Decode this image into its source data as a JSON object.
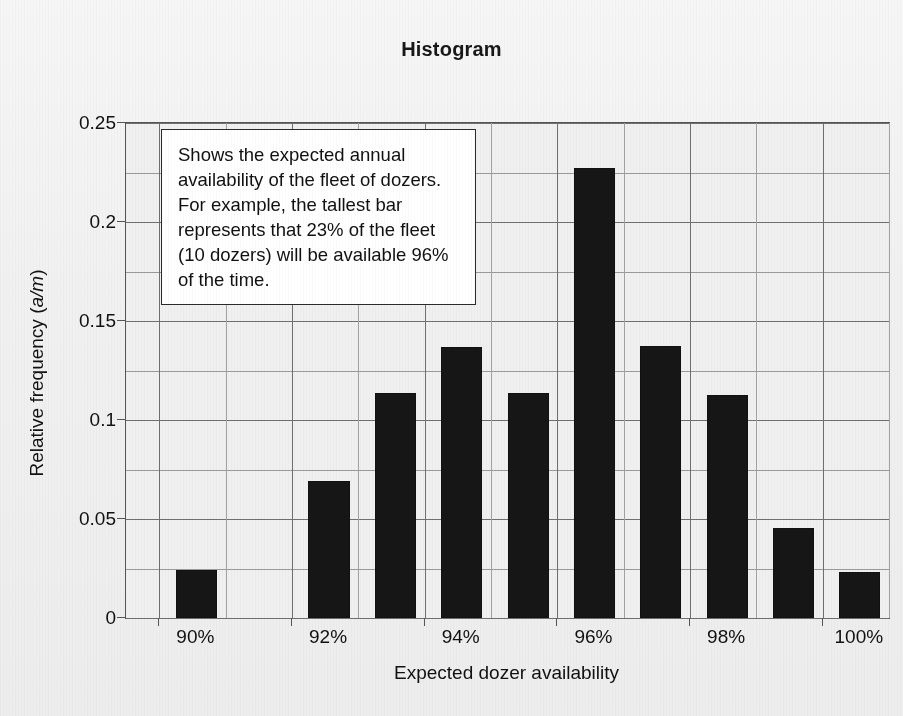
{
  "title": "Histogram",
  "annotation": {
    "text": "Shows the expected annual availability of the fleet of dozers. For example, the tallest bar represents that 23% of the fleet (10 dozers) will be available 96% of the time."
  },
  "axes": {
    "x_title": "Expected dozer availability",
    "y_title_main": "Relative frequency (",
    "y_title_italic": "a/m",
    "y_title_tail": ")",
    "y_ticks": [
      "0",
      "0.05",
      "0.1",
      "0.15",
      "0.2",
      "0.25"
    ],
    "x_ticks": [
      "90%",
      "92%",
      "94%",
      "96%",
      "98%",
      "100%"
    ]
  },
  "chart_data": {
    "type": "bar",
    "title": "Histogram",
    "xlabel": "Expected dozer availability",
    "ylabel": "Relative frequency (a/m)",
    "ylim": [
      0,
      0.25
    ],
    "xlim": [
      89.5,
      101
    ],
    "grid": true,
    "legend": "none",
    "y_tick_values": [
      0,
      0.05,
      0.1,
      0.15,
      0.2,
      0.25
    ],
    "y_minor_step": 0.025,
    "x_tick_values": [
      90,
      92,
      94,
      96,
      98,
      100
    ],
    "categories": [
      "90%",
      "91%",
      "92%",
      "93%",
      "94%",
      "95%",
      "96%",
      "97%",
      "98%",
      "99%",
      "100%"
    ],
    "values": [
      0.0245,
      0.0,
      0.069,
      0.1135,
      0.137,
      0.1135,
      0.2275,
      0.1375,
      0.1125,
      0.0455,
      0.023
    ],
    "annotation": "Shows the expected annual availability of the fleet of dozers. For example, the tallest bar represents that 23% of the fleet (10 dozers) will be available 96% of the time.",
    "bar_color": "#161616"
  },
  "colors": {
    "bar": "#161616",
    "grid_major": "#6f6f6f",
    "grid_minor": "#a2a2a2",
    "frame": "#555555",
    "background": "#f1f1f1",
    "note_background": "#ffffff",
    "text": "#111111"
  }
}
